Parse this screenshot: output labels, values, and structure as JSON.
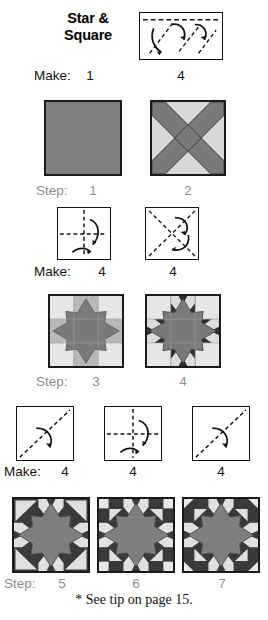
{
  "title": "Star &\nSquare",
  "title_line1": "Star &",
  "title_line2": "Square",
  "footnote": "* See tip on page 15.",
  "labels": {
    "make": "Make:",
    "step": "Step:"
  },
  "colors": {
    "dark_star": "#7a7a7a",
    "mid_gray": "#b0b0b0",
    "light_gray": "#e2e2e2",
    "very_dark": "#2e2e2e",
    "solid_square": "#808080",
    "outline": "#1b1b1b",
    "label_gray": "#8d8d8d",
    "text": "#111111"
  },
  "rows": [
    {
      "row_name": "fold-row-1",
      "label": "Make:",
      "figures": [
        {
          "name": "fold-diagram-wide-rect",
          "count": "1",
          "kind": "fold",
          "shape": "wide-rectangle-dashed-diagonals"
        }
      ],
      "counts": [
        "1",
        "4"
      ]
    },
    {
      "row_name": "block-row-1",
      "label": "Step:",
      "figures": [
        {
          "name": "block-solid-square",
          "step": "1",
          "kind": "block",
          "shape": "solid-gray-square"
        },
        {
          "name": "block-x-cross",
          "step": "2",
          "kind": "block",
          "shape": "x-cross-on-light"
        }
      ],
      "counts": [
        "1",
        "2"
      ]
    },
    {
      "row_name": "fold-row-2",
      "label": "Make:",
      "figures": [
        {
          "name": "fold-diagram-cross",
          "count": "4",
          "kind": "fold",
          "shape": "cross-dashed"
        },
        {
          "name": "fold-diagram-diagonal-x",
          "count": "4",
          "kind": "fold",
          "shape": "diagonal-x-dashed"
        }
      ],
      "counts": [
        "4",
        "4"
      ]
    },
    {
      "row_name": "block-row-2",
      "label": "Step:",
      "figures": [
        {
          "name": "block-star-light",
          "step": "3",
          "kind": "block",
          "shape": "star-nine-patch-light"
        },
        {
          "name": "block-star-dark-accent",
          "step": "4",
          "kind": "block",
          "shape": "star-nine-patch-dark-accent"
        }
      ],
      "counts": [
        "3",
        "4"
      ]
    },
    {
      "row_name": "fold-row-3",
      "label": "Make:",
      "figures": [
        {
          "name": "fold-diagram-diagonal-a",
          "count": "4",
          "kind": "fold",
          "shape": "diagonal-dashed"
        },
        {
          "name": "fold-diagram-cross-b",
          "count": "4",
          "kind": "fold",
          "shape": "cross-dashed"
        },
        {
          "name": "fold-diagram-diagonal-c",
          "count": "4",
          "kind": "fold",
          "shape": "diagonal-dashed"
        }
      ],
      "counts": [
        "4",
        "4",
        "4"
      ]
    },
    {
      "row_name": "block-row-3",
      "label": "Step:",
      "figures": [
        {
          "name": "block-final-plain",
          "step": "5",
          "kind": "block",
          "shape": "star-dark-bg-plain-corners"
        },
        {
          "name": "block-final-squares",
          "step": "6",
          "kind": "block",
          "shape": "star-dark-bg-corner-squares"
        },
        {
          "name": "block-final-triangles",
          "step": "7",
          "kind": "block",
          "shape": "star-dark-bg-corner-triangles"
        }
      ],
      "counts": [
        "5",
        "6",
        "7"
      ]
    }
  ]
}
